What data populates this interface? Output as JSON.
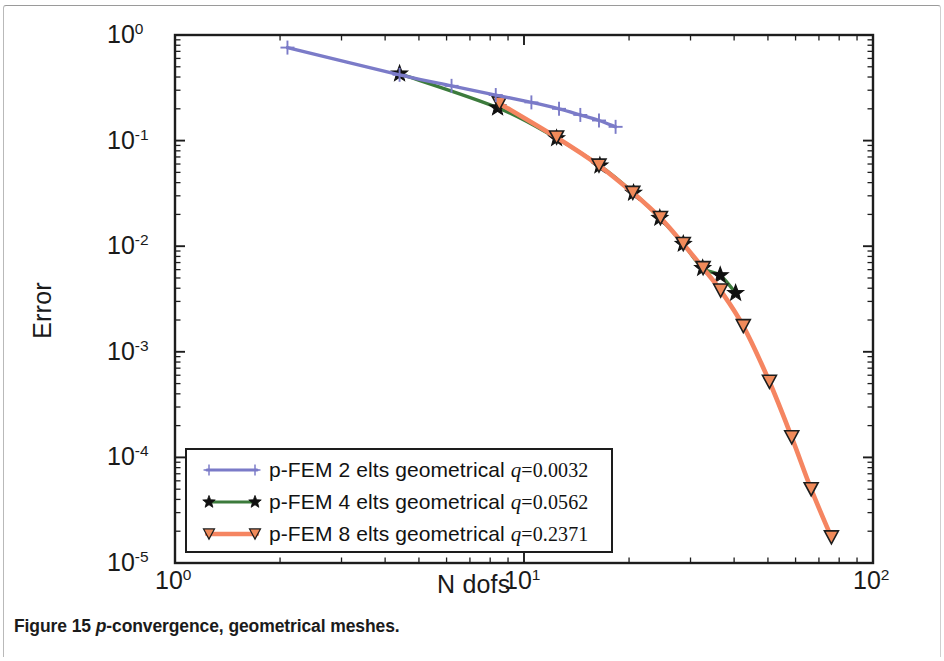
{
  "figure": {
    "caption_prefix": "Figure 15",
    "caption_italic": "p",
    "caption_rest": "-convergence, geometrical meshes."
  },
  "axes": {
    "ylabel": "Error",
    "xlabel": "N dofs",
    "y_ticks": [
      {
        "mantissa": "10",
        "exp": "0"
      },
      {
        "mantissa": "10",
        "exp": "-1"
      },
      {
        "mantissa": "10",
        "exp": "-2"
      },
      {
        "mantissa": "10",
        "exp": "-3"
      },
      {
        "mantissa": "10",
        "exp": "-4"
      },
      {
        "mantissa": "10",
        "exp": "-5"
      }
    ],
    "x_ticks": [
      {
        "mantissa": "10",
        "exp": "0"
      },
      {
        "mantissa": "10",
        "exp": "1"
      },
      {
        "mantissa": "10",
        "exp": "2"
      }
    ]
  },
  "legend": {
    "items": [
      {
        "label_main": "p-FEM 2 elts geometrical ",
        "q_var": "q",
        "q_eq": "=",
        "q_val": "0.0032",
        "color": "#7b7bc8",
        "marker": "plus"
      },
      {
        "label_main": "p-FEM 4 elts geometrical ",
        "q_var": "q",
        "q_eq": "=",
        "q_val": "0.0562",
        "color": "#3c7b3c",
        "marker": "star"
      },
      {
        "label_main": "p-FEM 8 elts geometrical ",
        "q_var": "q",
        "q_eq": "=",
        "q_val": "0.2371",
        "color": "#f58561",
        "marker": "triangle-down"
      }
    ]
  },
  "chart_data": {
    "type": "line",
    "title": "p-convergence, geometrical meshes",
    "xlabel": "N dofs",
    "ylabel": "Error",
    "xscale": "log",
    "yscale": "log",
    "xlim": [
      1,
      100
    ],
    "ylim": [
      1e-05,
      1
    ],
    "grid": false,
    "legend_position": "lower-left-inside",
    "series": [
      {
        "name": "p-FEM 2 elts geometrical q=0.0032",
        "color": "#7b7bc8",
        "marker": "plus",
        "x": [
          2.1,
          4.4,
          6.2,
          8.3,
          10.5,
          12.6,
          14.5,
          16.4,
          18.3
        ],
        "y": [
          0.76,
          0.42,
          0.33,
          0.27,
          0.23,
          0.2,
          0.175,
          0.155,
          0.135
        ]
      },
      {
        "name": "p-FEM 4 elts geometrical q=0.0562",
        "color": "#3c7b3c",
        "marker": "star",
        "x": [
          4.4,
          8.4,
          12.4,
          16.5,
          20.6,
          24.5,
          28.6,
          32.5,
          36.5,
          40.4
        ],
        "y": [
          0.43,
          0.205,
          0.105,
          0.058,
          0.032,
          0.0185,
          0.0105,
          0.0062,
          0.0053,
          0.0036
        ]
      },
      {
        "name": "p-FEM 8 elts geometrical q=0.2371",
        "color": "#f58561",
        "marker": "triangle-down",
        "x": [
          8.5,
          12.4,
          16.4,
          20.5,
          24.6,
          28.6,
          32.6,
          36.6,
          42.5,
          50.5,
          58.5,
          66.5,
          76.0
        ],
        "y": [
          0.225,
          0.107,
          0.058,
          0.032,
          0.0185,
          0.0105,
          0.0062,
          0.0038,
          0.00175,
          0.00052,
          0.000155,
          5e-05,
          1.75e-05
        ]
      }
    ]
  }
}
